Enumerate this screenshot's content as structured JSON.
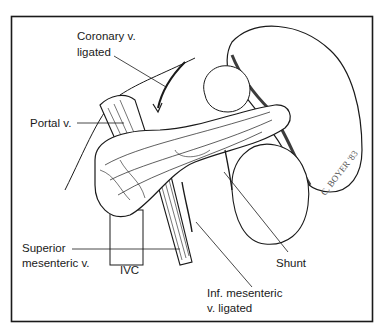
{
  "figure": {
    "type": "medical-illustration",
    "labels": {
      "coronary_line1": "Coronary v.",
      "coronary_line2": "ligated",
      "portal": "Portal v.",
      "sup_mes_line1": "Superior",
      "sup_mes_line2": "mesenteric v.",
      "ivc": "IVC",
      "shunt": "Shunt",
      "inf_mes_line1": "Inf. mesenteric",
      "inf_mes_line2": "v. ligated"
    },
    "signature": "C. BOYER '83",
    "colors": {
      "ink": "#1a1a1a",
      "background": "#ffffff"
    }
  }
}
